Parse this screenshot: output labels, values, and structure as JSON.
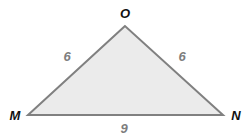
{
  "diagram": {
    "type": "triangle",
    "colors": {
      "fill": "#ebebeb",
      "stroke": "#808080",
      "vertex_label": "#111111",
      "side_label": "#7d7d7d"
    },
    "vertices": [
      {
        "label": "O",
        "x": 125,
        "y": 26,
        "label_x": 125,
        "label_y": 18
      },
      {
        "label": "M",
        "x": 28,
        "y": 115,
        "label_x": 15,
        "label_y": 120
      },
      {
        "label": "N",
        "x": 223,
        "y": 115,
        "label_x": 236,
        "label_y": 120
      }
    ],
    "sides": [
      {
        "name": "MO",
        "label": "6",
        "label_x": 67,
        "label_y": 61
      },
      {
        "name": "ON",
        "label": "6",
        "label_x": 182,
        "label_y": 61
      },
      {
        "name": "MN",
        "label": "9",
        "label_x": 124,
        "label_y": 133
      }
    ]
  }
}
